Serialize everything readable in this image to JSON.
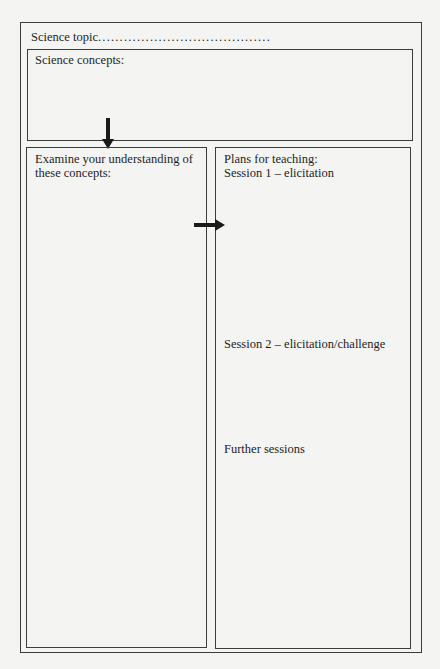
{
  "worksheet": {
    "topic_label": "Science topic",
    "topic_dots": "........................................",
    "concepts_label": "Science concepts:",
    "left_column": {
      "label": "Examine your understanding of these concepts:"
    },
    "right_column": {
      "plans_label": "Plans for teaching:",
      "sessions": [
        {
          "label": "Session 1 – elicitation"
        },
        {
          "label": "Session 2 – elicitation/challenge"
        },
        {
          "label": "Further sessions"
        }
      ]
    },
    "arrows": [
      {
        "icon": "arrow-down-icon",
        "from": "concepts",
        "to": "left_column"
      },
      {
        "icon": "arrow-right-icon",
        "from": "left_column",
        "to": "right_column"
      }
    ],
    "colors": {
      "background": "#f4f4f2",
      "border": "#3c3c3c",
      "text": "#1e1e1e"
    }
  }
}
